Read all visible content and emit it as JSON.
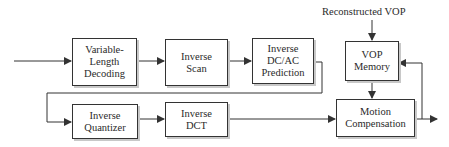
{
  "diagram": {
    "title_label": "Reconstructed VOP",
    "blocks": {
      "vld": "Variable-\nLength\nDecoding",
      "inverse_scan": "Inverse\nScan",
      "dcac": "Inverse\nDC/AC\nPrediction",
      "vop_memory": "VOP\nMemory",
      "inverse_quantizer": "Inverse\nQuantizer",
      "inverse_dct": "Inverse\nDCT",
      "motion_compensation": "Motion\nCompensation"
    },
    "colors": {
      "line": "#333333",
      "text": "#2a2a2a",
      "shadow": "#c8c8c8"
    }
  }
}
